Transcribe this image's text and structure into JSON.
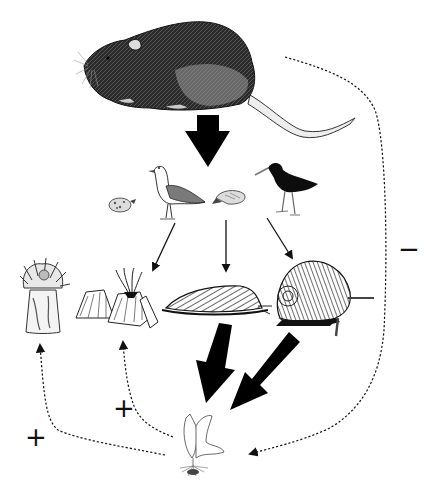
{
  "diagram": {
    "type": "trophic-cascade-food-web",
    "nodes": [
      {
        "id": "rat",
        "label": "rat",
        "level": "top-predator"
      },
      {
        "id": "birds",
        "label": "shorebirds (gull, chicks, oystercatcher)",
        "level": "mesopredators",
        "members": [
          "gull-chick",
          "gull",
          "chick",
          "oystercatcher"
        ]
      },
      {
        "id": "anemone",
        "label": "sea anemone",
        "level": "sessile-invertebrate"
      },
      {
        "id": "barnacles",
        "label": "barnacles",
        "level": "sessile-invertebrate"
      },
      {
        "id": "chiton",
        "label": "chiton / limpet",
        "level": "grazer"
      },
      {
        "id": "snail",
        "label": "snail",
        "level": "grazer"
      },
      {
        "id": "algae",
        "label": "algae",
        "level": "primary-producer"
      }
    ],
    "edges": [
      {
        "from": "rat",
        "to": "birds",
        "style": "thick-solid",
        "meaning": "strong direct effect"
      },
      {
        "from": "birds",
        "to": "barnacles",
        "style": "thin-solid"
      },
      {
        "from": "birds",
        "to": "chiton",
        "style": "thin-solid"
      },
      {
        "from": "birds",
        "to": "snail",
        "style": "thin-solid"
      },
      {
        "from": "chiton",
        "to": "algae",
        "style": "thick-solid"
      },
      {
        "from": "snail",
        "to": "algae",
        "style": "thick-solid"
      },
      {
        "from": "rat",
        "to": "algae",
        "style": "dashed",
        "sign": "−"
      },
      {
        "from": "algae",
        "to": "anemone",
        "style": "dashed",
        "sign": "+"
      },
      {
        "from": "algae",
        "to": "barnacles",
        "style": "dashed",
        "sign": "+"
      }
    ],
    "signs": {
      "minus": "−",
      "plus_left": "+",
      "plus_mid": "+"
    },
    "colors": {
      "ink": "#111111",
      "background": "#ffffff"
    }
  }
}
